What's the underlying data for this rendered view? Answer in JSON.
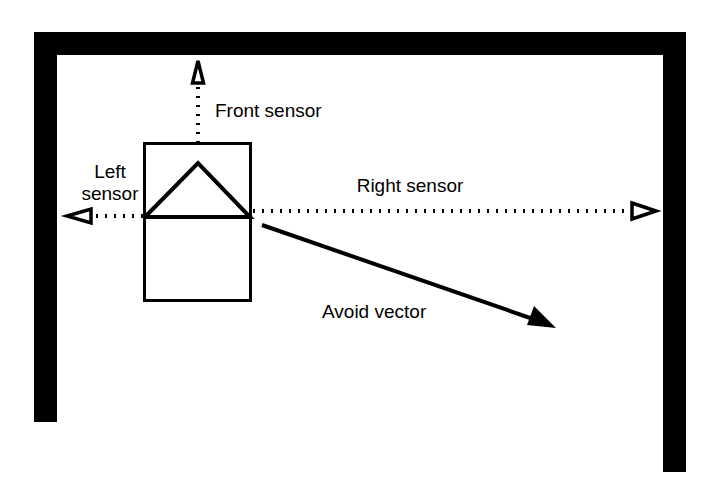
{
  "figure": {
    "kind": "robot-obstacle-avoidance-diagram",
    "background_color": "#ffffff",
    "ink_color": "#000000",
    "width": 723,
    "height": 490
  },
  "labels": {
    "front_sensor": "Front sensor",
    "left_sensor_line1": "Left",
    "left_sensor_line2": "sensor",
    "right_sensor": "Right sensor",
    "avoid_vector": "Avoid vector"
  },
  "walls": {
    "color": "#000000",
    "thickness": 23,
    "top_wall": {
      "x1": 34,
      "y1": 32,
      "x2": 686,
      "y2": 55
    },
    "left_wall": {
      "x1": 34,
      "y1": 32,
      "x2": 57,
      "y2": 422
    },
    "right_wall": {
      "x1": 663,
      "y1": 32,
      "x2": 686,
      "y2": 472
    }
  },
  "robot": {
    "body": {
      "x": 144,
      "y": 143,
      "width": 107,
      "height": 158
    },
    "heading_triangle": {
      "apex_x": 198,
      "apex_y": 163,
      "base_y": 217,
      "left_x": 145,
      "right_x": 250
    }
  },
  "sensors": [
    {
      "id": "front-sensor",
      "direction": "up",
      "origin": {
        "x": 198,
        "y": 143
      },
      "beam_end": {
        "x": 198,
        "y": 83
      },
      "tip": {
        "x": 198,
        "y": 60
      },
      "head_style": "hollow-triangle",
      "label_x": 215,
      "label_y": 117
    },
    {
      "id": "left-sensor",
      "direction": "left",
      "origin": {
        "x": 144,
        "y": 216
      },
      "beam_end": {
        "x": 92,
        "y": 216
      },
      "tip": {
        "x": 66,
        "y": 216
      },
      "head_style": "hollow-triangle",
      "label_x": 110,
      "label_y_line1": 178,
      "label_y_line2": 200
    },
    {
      "id": "right-sensor",
      "direction": "right",
      "origin": {
        "x": 252,
        "y": 211
      },
      "beam_end": {
        "x": 630,
        "y": 211
      },
      "tip": {
        "x": 656,
        "y": 211
      },
      "head_style": "hollow-triangle",
      "label_x": 410,
      "label_y": 192
    }
  ],
  "avoid_vector": {
    "start": {
      "x": 262,
      "y": 225
    },
    "end": {
      "x": 555,
      "y": 327
    },
    "head_style": "solid-triangle",
    "label_x": 322,
    "label_y": 318
  }
}
